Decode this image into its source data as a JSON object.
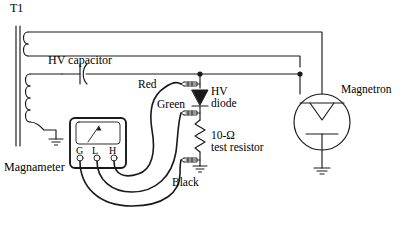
{
  "figure": {
    "type": "circuit-diagram",
    "background_color": "#ffffff",
    "line_color": "#1a1a1a"
  },
  "labels": {
    "transformer": "T1",
    "capacitor": "HV capacitor",
    "wire_red": "Red",
    "wire_green": "Green",
    "wire_black": "Black",
    "diode": "HV\ndiode",
    "diode_line1": "HV",
    "diode_line2": "diode",
    "resistor_line1": "10-Ω",
    "resistor_line2": "test resistor",
    "magnetron": "Magnetron",
    "meter": "Magnameter"
  },
  "meter": {
    "name": "Magnameter",
    "terminals": [
      {
        "id": "G",
        "label": "G"
      },
      {
        "id": "L",
        "label": "L"
      },
      {
        "id": "H",
        "label": "H"
      }
    ],
    "needle_deflection_percent": 62
  },
  "components": [
    {
      "name": "T1",
      "type": "transformer",
      "windings": [
        "filament",
        "high-voltage"
      ],
      "grounded": true
    },
    {
      "name": "HV capacitor",
      "type": "capacitor"
    },
    {
      "name": "HV diode",
      "type": "diode"
    },
    {
      "name": "10-Ω test resistor",
      "type": "resistor",
      "resistance": "10 Ω"
    },
    {
      "name": "Magnetron",
      "type": "magnetron",
      "grounded": true
    },
    {
      "name": "Magnameter",
      "type": "test-meter",
      "terminals": "G L H"
    }
  ],
  "test_leads": [
    {
      "color": "Red",
      "from": "Magnameter H",
      "to": "HV diode anode clip"
    },
    {
      "color": "Green",
      "from": "Magnameter L",
      "to": "HV diode cathode clip"
    },
    {
      "color": "Black",
      "from": "Magnameter G",
      "to": "test resistor ground clip"
    }
  ],
  "clips": [
    {
      "id": "clip-top",
      "position": "above HV diode"
    },
    {
      "id": "clip-middle",
      "position": "between HV diode and test resistor"
    },
    {
      "id": "clip-bottom",
      "position": "below test resistor at ground"
    }
  ]
}
